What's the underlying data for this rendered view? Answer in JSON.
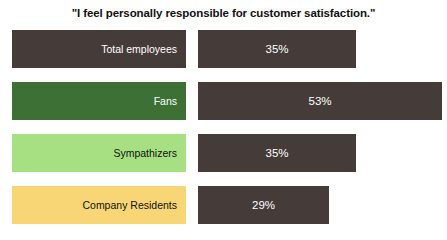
{
  "chart_data": {
    "type": "bar",
    "title": "\"I feel personally responsible for customer satisfaction.\"",
    "xlabel": "",
    "ylabel": "",
    "orientation": "horizontal",
    "grid": false,
    "legend": "none",
    "xlim": [
      0,
      60
    ],
    "categories": [
      "Total employees",
      "Fans",
      "Sympathizers",
      "Company Residents"
    ],
    "values": [
      35,
      53,
      35,
      29
    ],
    "value_labels": [
      "35%",
      "53%",
      "35%",
      "29%"
    ],
    "category_colors": [
      "#453c39",
      "#3c7034",
      "#a7e083",
      "#f8d675"
    ],
    "category_label_colors": [
      "#ffffff",
      "#ffffff",
      "#111111",
      "#111111"
    ],
    "bar_color": "#453c39",
    "bar_label_color": "#ffffff",
    "background": "#ffffff"
  },
  "rows": [
    {
      "label": "Total employees",
      "value_label": "35%",
      "value": 35,
      "cat_color": "#453c39",
      "cat_text_color": "#ffffff",
      "cat_width_px": 174,
      "bar_left_px": 198,
      "bar_width_px": 158
    },
    {
      "label": "Fans",
      "value_label": "53%",
      "value": 53,
      "cat_color": "#3c7034",
      "cat_text_color": "#ffffff",
      "cat_width_px": 174,
      "bar_left_px": 198,
      "bar_width_px": 244
    },
    {
      "label": "Sympathizers",
      "value_label": "35%",
      "value": 35,
      "cat_color": "#a7e083",
      "cat_text_color": "#111111",
      "cat_width_px": 174,
      "bar_left_px": 198,
      "bar_width_px": 158
    },
    {
      "label": "Company Residents",
      "value_label": "29%",
      "value": 29,
      "cat_color": "#f8d675",
      "cat_text_color": "#111111",
      "cat_width_px": 174,
      "bar_left_px": 198,
      "bar_width_px": 131
    }
  ]
}
